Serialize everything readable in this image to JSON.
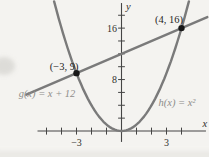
{
  "figure": {
    "colors": {
      "background": "#f4f3f0",
      "axis": "#454545",
      "curve": "#7a7a7a",
      "point": "#171717",
      "coord_label": "#262626",
      "tick_label": "#32302c",
      "function_label": "#8e8d8a"
    }
  },
  "chart_data": {
    "type": "line",
    "title": "",
    "grid": false,
    "legend": "none",
    "x_axis": {
      "label": "x",
      "lim": [
        -5.6,
        5.63
      ],
      "tick_step": 1,
      "ticks": [
        -5,
        -4,
        -3,
        -2,
        -1,
        1,
        2,
        3,
        4
      ],
      "tick_labels": {
        "-3": "−3",
        "3": "3"
      }
    },
    "y_axis": {
      "label": "y",
      "lim": [
        -1.7,
        19.9
      ],
      "tick_step": 2,
      "ticks": [
        2,
        4,
        6,
        8,
        10,
        12,
        14,
        16,
        18
      ],
      "tick_labels": {
        "8": "8",
        "16": "16"
      }
    },
    "series": [
      {
        "name": "g",
        "label": "g(x) = x + 12",
        "type": "linear",
        "slope": 1,
        "intercept": 12,
        "domain": [
          -6.35,
          5.72
        ]
      },
      {
        "name": "h",
        "label": "h(x) = x²",
        "type": "quadratic",
        "a": 1,
        "domain": [
          -4.49,
          4.49
        ]
      }
    ],
    "points": [
      {
        "x": -3,
        "y": 9,
        "label": "(−3, 9)"
      },
      {
        "x": 4,
        "y": 16,
        "label": "(4, 16)"
      }
    ]
  }
}
